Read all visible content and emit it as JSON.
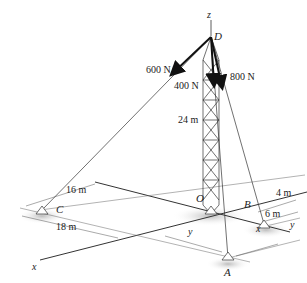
{
  "diagram": {
    "type": "3D statics diagram - guyed tower",
    "axes": {
      "z": "z",
      "x": "x",
      "y": "y"
    },
    "points": {
      "D": "D",
      "O": "O",
      "A": "A",
      "B": "B",
      "C": "C"
    },
    "forces": [
      {
        "label": "600 N",
        "from": "D",
        "toward": "C"
      },
      {
        "label": "400 N",
        "from": "D",
        "toward": "A"
      },
      {
        "label": "800 N",
        "from": "D",
        "toward": "B"
      }
    ],
    "dimensions": {
      "height": "24 m",
      "c_offset_y": "16 m",
      "c_offset_x": "18 m",
      "b_offset_x": "4 m",
      "b_offset_y": "6 m",
      "a_y": "y",
      "a_x": "x"
    },
    "colors": {
      "line": "#333333",
      "arrow": "#111111",
      "shadow": "#cfcfcf"
    }
  }
}
